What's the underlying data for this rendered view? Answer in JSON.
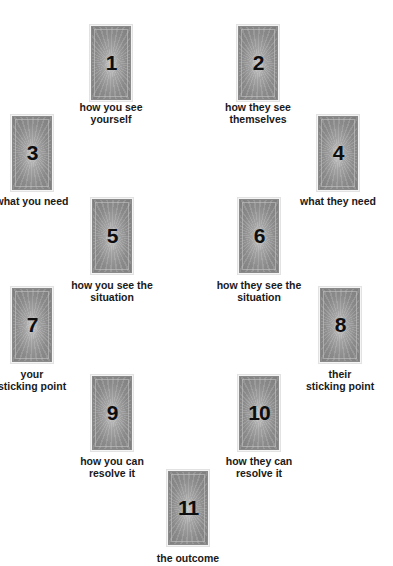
{
  "spread": {
    "card_color": "#8a8a8a",
    "text_color": "#1a1a1a",
    "positions": [
      {
        "number": "1",
        "label_line1": "how you see",
        "label_line2": "yourself"
      },
      {
        "number": "2",
        "label_line1": "how they see",
        "label_line2": "themselves"
      },
      {
        "number": "3",
        "label_line1": "what you need",
        "label_line2": ""
      },
      {
        "number": "4",
        "label_line1": "what they need",
        "label_line2": ""
      },
      {
        "number": "5",
        "label_line1": "how you see the",
        "label_line2": "situation"
      },
      {
        "number": "6",
        "label_line1": "how they see the",
        "label_line2": "situation"
      },
      {
        "number": "7",
        "label_line1": "your",
        "label_line2": "sticking point"
      },
      {
        "number": "8",
        "label_line1": "their",
        "label_line2": "sticking point"
      },
      {
        "number": "9",
        "label_line1": "how you can",
        "label_line2": "resolve it"
      },
      {
        "number": "10",
        "label_line1": "how they can",
        "label_line2": "resolve it"
      },
      {
        "number": "11",
        "label_line1": "the outcome",
        "label_line2": ""
      }
    ]
  }
}
